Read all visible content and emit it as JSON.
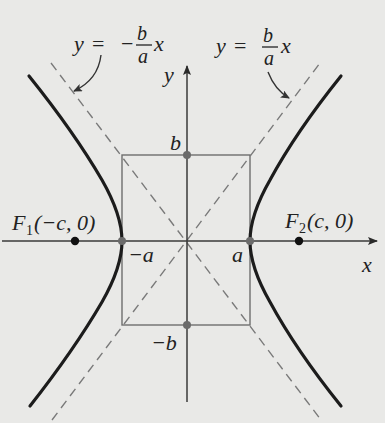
{
  "figure": {
    "type": "hyperbola-diagram",
    "colors": {
      "background": "#e9e9e7",
      "curve": "#1c1c1c",
      "axis": "#3a3a3a",
      "box": "#6e6e6e",
      "asymptote": "#7a7a7a",
      "vertex_point": "#6b6b6b",
      "focus_point": "#111111"
    },
    "axes": {
      "x_label": "x",
      "y_label": "y"
    },
    "asymptotes": {
      "negative": {
        "lhs": "y =",
        "sign": "−",
        "num": "b",
        "den": "a",
        "var": "x"
      },
      "positive": {
        "lhs": "y =",
        "num": "b",
        "den": "a",
        "var": "x"
      }
    },
    "labels": {
      "b": "b",
      "neg_b": "−b",
      "a": "a",
      "neg_a": "−a",
      "focus1_main": "F",
      "focus1_sub": "1",
      "focus1_coords": "(−c, 0)",
      "focus2_main": "F",
      "focus2_sub": "2",
      "focus2_coords": "(c, 0)"
    },
    "points": [
      {
        "name": "F1",
        "x": "-c",
        "y": 0
      },
      {
        "name": "vertex-left",
        "x": "-a",
        "y": 0
      },
      {
        "name": "vertex-right",
        "x": "a",
        "y": 0
      },
      {
        "name": "F2",
        "x": "c",
        "y": 0
      },
      {
        "name": "co-vertex-top",
        "x": 0,
        "y": "b"
      },
      {
        "name": "co-vertex-bottom",
        "x": 0,
        "y": "-b"
      }
    ]
  }
}
